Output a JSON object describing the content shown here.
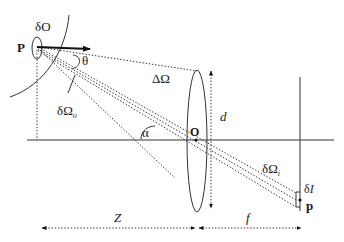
{
  "diagram": {
    "type": "optics-radiometry-lens-geometry",
    "labels": {
      "surface_patch": "δO",
      "point_P": "P",
      "angle_theta": "θ",
      "solid_angle_lens": "ΔΩ",
      "solid_angle_object": "δΩ",
      "solid_angle_object_sub": "o",
      "angle_alpha": "α",
      "lens_center": "O",
      "lens_diameter": "d",
      "solid_angle_image": "δΩ",
      "solid_angle_image_sub": "i",
      "image_patch": "δI",
      "image_point": "p",
      "distance_object": "Z",
      "focal_length": "f"
    },
    "colors": {
      "line": "#333333",
      "text": "#1a1a1a",
      "background": "#ffffff"
    }
  }
}
